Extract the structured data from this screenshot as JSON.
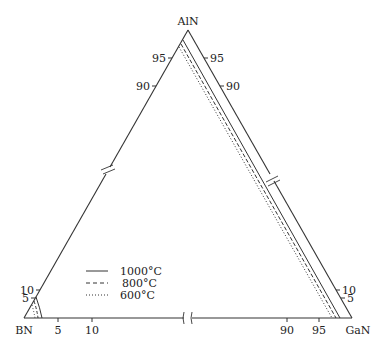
{
  "diagram": {
    "type": "ternary-phase-diagram",
    "vertices": {
      "top": "AlN",
      "left": "BN",
      "right": "GaN"
    },
    "left_edge_ticks": [
      "95",
      "90",
      "10",
      "5"
    ],
    "right_edge_ticks": [
      "95",
      "90",
      "10",
      "5"
    ],
    "bottom_edge_ticks": [
      "5",
      "10",
      "90",
      "95"
    ],
    "legend": [
      {
        "label": "1000°C",
        "style": "solid"
      },
      {
        "label": "800°C",
        "style": "dashed"
      },
      {
        "label": "600°C",
        "style": "dotted"
      }
    ],
    "colors": {
      "line": "#333333",
      "background": "#ffffff"
    }
  }
}
